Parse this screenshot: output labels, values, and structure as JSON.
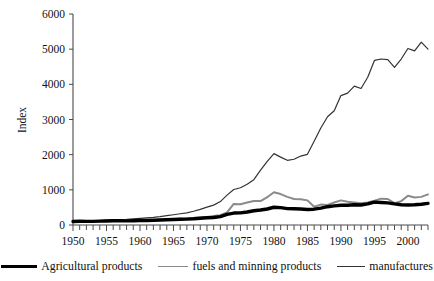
{
  "chart_data": {
    "type": "line",
    "title": "",
    "xlabel": "",
    "ylabel": "Index",
    "xlim": [
      1950,
      2003
    ],
    "ylim": [
      0,
      6000
    ],
    "ytick_values": [
      0,
      1000,
      2000,
      3000,
      4000,
      5000,
      6000
    ],
    "ytick_labels": [
      "0",
      "1000",
      "2000",
      "3000",
      "4000",
      "5000",
      "6000"
    ],
    "xtick_labels": [
      "1950",
      "1955",
      "1960",
      "1965",
      "1970",
      "1975",
      "1980",
      "1985",
      "1990",
      "1995",
      "2000"
    ],
    "xtick_values": [
      1950,
      1955,
      1960,
      1965,
      1970,
      1975,
      1980,
      1985,
      1990,
      1995,
      2000
    ],
    "minor_xticks_every": 1,
    "grid": false,
    "legend_position": "bottom",
    "x": [
      1950,
      1951,
      1952,
      1953,
      1954,
      1955,
      1956,
      1957,
      1958,
      1959,
      1960,
      1961,
      1962,
      1963,
      1964,
      1965,
      1966,
      1967,
      1968,
      1969,
      1970,
      1971,
      1972,
      1973,
      1974,
      1975,
      1976,
      1977,
      1978,
      1979,
      1980,
      1981,
      1982,
      1983,
      1984,
      1985,
      1986,
      1987,
      1988,
      1989,
      1990,
      1991,
      1992,
      1993,
      1994,
      1995,
      1996,
      1997,
      1998,
      1999,
      2000,
      2001,
      2002,
      2003
    ],
    "series": [
      {
        "name": "Agricultural products",
        "color": "#000000",
        "line_width": 3.4,
        "values": [
          100,
          108,
          104,
          104,
          110,
          115,
          120,
          122,
          118,
          122,
          128,
          130,
          134,
          142,
          150,
          156,
          164,
          168,
          176,
          190,
          205,
          214,
          240,
          300,
          340,
          345,
          370,
          405,
          425,
          455,
          505,
          495,
          465,
          460,
          455,
          440,
          450,
          480,
          520,
          545,
          560,
          560,
          575,
          570,
          600,
          650,
          640,
          630,
          600,
          575,
          570,
          575,
          590,
          615
        ]
      },
      {
        "name": "fuels and minning products",
        "color": "#8a8a8a",
        "line_width": 2.0,
        "values": [
          100,
          110,
          108,
          106,
          110,
          118,
          126,
          132,
          126,
          128,
          134,
          136,
          140,
          150,
          160,
          168,
          178,
          184,
          196,
          212,
          230,
          258,
          280,
          360,
          600,
          590,
          640,
          680,
          680,
          790,
          930,
          880,
          800,
          740,
          735,
          700,
          520,
          580,
          570,
          640,
          700,
          660,
          640,
          620,
          640,
          690,
          750,
          740,
          620,
          680,
          830,
          780,
          800,
          870
        ]
      },
      {
        "name": "manufactures",
        "color": "#333333",
        "line_width": 1.2,
        "values": [
          100,
          112,
          112,
          116,
          124,
          136,
          148,
          156,
          158,
          172,
          190,
          202,
          216,
          238,
          266,
          292,
          320,
          344,
          390,
          446,
          510,
          566,
          666,
          850,
          1010,
          1060,
          1160,
          1290,
          1560,
          1810,
          2030,
          1930,
          1840,
          1870,
          1960,
          2010,
          2380,
          2760,
          3080,
          3250,
          3680,
          3750,
          3950,
          3880,
          4200,
          4680,
          4720,
          4700,
          4480,
          4720,
          5020,
          4950,
          5200,
          5000
        ]
      }
    ]
  },
  "legend": {
    "entries": [
      {
        "label": "Agricultural products",
        "swatch": "agri"
      },
      {
        "label": "fuels and minning products",
        "swatch": "fuel"
      },
      {
        "label": "manufactures",
        "swatch": "manu"
      }
    ]
  },
  "axes": {
    "y_title": "Index"
  }
}
